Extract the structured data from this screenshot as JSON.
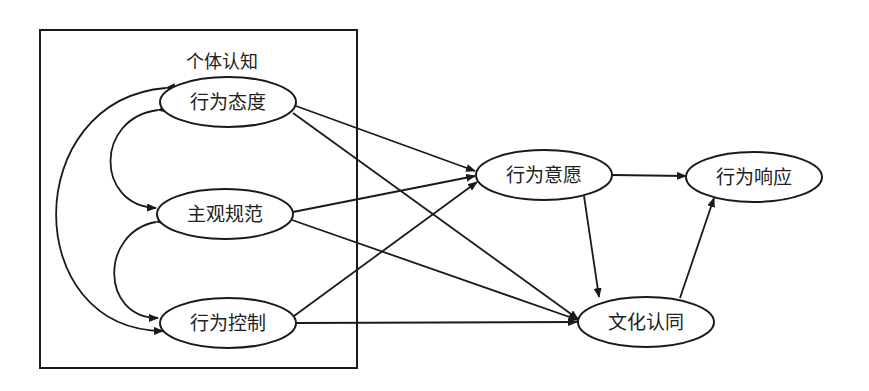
{
  "diagram": {
    "group": {
      "label": "个体认知",
      "box": {
        "x": 40,
        "y": 30,
        "w": 317,
        "h": 338
      }
    },
    "nodes": [
      {
        "id": "attitude",
        "label": "行为态度",
        "cx": 228,
        "cy": 102,
        "rx": 68,
        "ry": 25
      },
      {
        "id": "norm",
        "label": "主观规范",
        "cx": 225,
        "cy": 214,
        "rx": 68,
        "ry": 25
      },
      {
        "id": "control",
        "label": "行为控制",
        "cx": 228,
        "cy": 323,
        "rx": 68,
        "ry": 25
      },
      {
        "id": "intention",
        "label": "行为意愿",
        "cx": 544,
        "cy": 175,
        "rx": 68,
        "ry": 25
      },
      {
        "id": "response",
        "label": "行为响应",
        "cx": 754,
        "cy": 177,
        "rx": 68,
        "ry": 25
      },
      {
        "id": "identity",
        "label": "文化认同",
        "cx": 646,
        "cy": 322,
        "rx": 68,
        "ry": 25
      }
    ],
    "edges": [
      {
        "from": "attitude",
        "to": "intention"
      },
      {
        "from": "attitude",
        "to": "identity"
      },
      {
        "from": "norm",
        "to": "intention"
      },
      {
        "from": "norm",
        "to": "identity"
      },
      {
        "from": "control",
        "to": "intention"
      },
      {
        "from": "control",
        "to": "identity"
      },
      {
        "from": "intention",
        "to": "response"
      },
      {
        "from": "intention",
        "to": "identity"
      },
      {
        "from": "identity",
        "to": "response"
      }
    ],
    "correlations": [
      {
        "between": [
          "attitude",
          "norm"
        ]
      },
      {
        "between": [
          "norm",
          "control"
        ]
      },
      {
        "between": [
          "attitude",
          "control"
        ]
      }
    ],
    "colors": {
      "stroke": "#1a1a1a",
      "background": "#ffffff",
      "text": "#222222"
    }
  }
}
